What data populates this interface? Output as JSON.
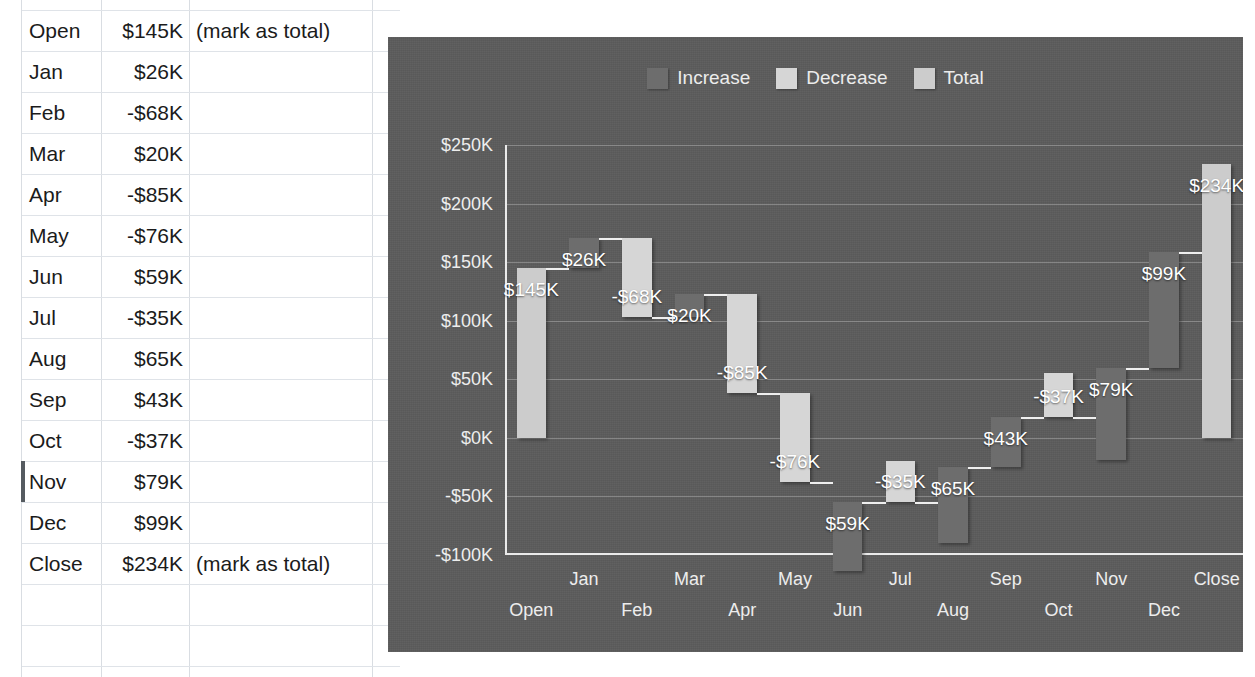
{
  "spreadsheet": {
    "columns": [
      "label",
      "value",
      "note"
    ],
    "rows": [
      {
        "label": "Open",
        "value": "$145K",
        "note": "(mark as total)"
      },
      {
        "label": "Jan",
        "value": "$26K",
        "note": ""
      },
      {
        "label": "Feb",
        "value": "-$68K",
        "note": ""
      },
      {
        "label": "Mar",
        "value": "$20K",
        "note": ""
      },
      {
        "label": "Apr",
        "value": "-$85K",
        "note": ""
      },
      {
        "label": "May",
        "value": "-$76K",
        "note": ""
      },
      {
        "label": "Jun",
        "value": "$59K",
        "note": ""
      },
      {
        "label": "Jul",
        "value": "-$35K",
        "note": ""
      },
      {
        "label": "Aug",
        "value": "$65K",
        "note": ""
      },
      {
        "label": "Sep",
        "value": "$43K",
        "note": ""
      },
      {
        "label": "Oct",
        "value": "-$37K",
        "note": ""
      },
      {
        "label": "Nov",
        "value": "$79K",
        "note": ""
      },
      {
        "label": "Dec",
        "value": "$99K",
        "note": ""
      },
      {
        "label": "Close",
        "value": "$234K",
        "note": "(mark as total)"
      },
      {
        "label": "",
        "value": "",
        "note": ""
      },
      {
        "label": "",
        "value": "",
        "note": ""
      }
    ],
    "selected_row_index": 11
  },
  "chart_data": {
    "type": "bar",
    "subtype": "waterfall",
    "title": "",
    "xlabel": "",
    "ylabel": "",
    "ylim": [
      -100,
      250
    ],
    "ytick_step": 50,
    "grid": true,
    "legend_position": "top-center",
    "legend": [
      {
        "name": "Increase",
        "color": "#6d6d6d"
      },
      {
        "name": "Decrease",
        "color": "#d6d6d6"
      },
      {
        "name": "Total",
        "color": "#cccccc"
      }
    ],
    "ytick_labels": [
      "$250K",
      "$200K",
      "$150K",
      "$100K",
      "$50K",
      "$0K",
      "-$50K",
      "-$100K"
    ],
    "ytick_values": [
      250,
      200,
      150,
      100,
      50,
      0,
      -50,
      -100
    ],
    "categories": [
      "Open",
      "Jan",
      "Feb",
      "Mar",
      "Apr",
      "May",
      "Jun",
      "Jul",
      "Aug",
      "Sep",
      "Oct",
      "Nov",
      "Dec",
      "Close"
    ],
    "values": [
      145,
      26,
      -68,
      20,
      -85,
      -76,
      59,
      -35,
      65,
      43,
      -37,
      79,
      99,
      234
    ],
    "kinds": [
      "total",
      "increase",
      "decrease",
      "increase",
      "decrease",
      "decrease",
      "increase",
      "decrease",
      "increase",
      "increase",
      "decrease",
      "increase",
      "increase",
      "total"
    ],
    "data_labels": [
      "$145K",
      "$26K",
      "-$68K",
      "$20K",
      "-$85K",
      "-$76K",
      "$59K",
      "-$35K",
      "$65K",
      "$43K",
      "-$37K",
      "$79K",
      "$99K",
      "$234K"
    ],
    "bar_bottoms": [
      0,
      145,
      103,
      103,
      38,
      -38,
      -114,
      -55,
      -90,
      -25,
      18,
      -19,
      60,
      0
    ],
    "bar_tops": [
      145,
      171,
      171,
      123,
      123,
      38,
      -55,
      -20,
      -25,
      18,
      55,
      60,
      159,
      234
    ],
    "unit": "K"
  }
}
